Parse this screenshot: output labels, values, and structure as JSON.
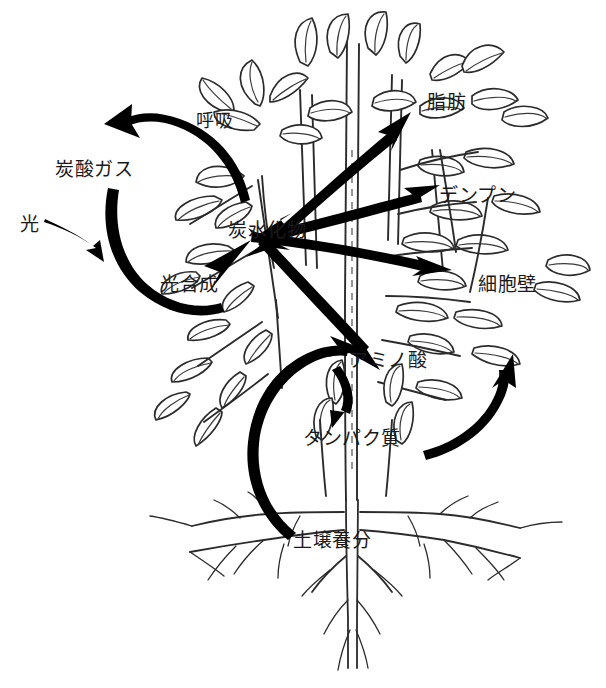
{
  "diagram": {
    "type": "plant-metabolism-flow-diagram",
    "colors": {
      "ink": "#1a1a1a",
      "arrow": "#000000",
      "background": "#ffffff",
      "line": "#2b2b2b"
    },
    "labels": [
      {
        "id": "respiration",
        "text": "呼吸",
        "x": 196,
        "y": 112,
        "role": "process"
      },
      {
        "id": "carbon-dioxide",
        "text": "炭酸ガス",
        "x": 55,
        "y": 160,
        "role": "substance"
      },
      {
        "id": "light",
        "text": "光",
        "x": 20,
        "y": 215,
        "role": "input"
      },
      {
        "id": "photosynthesis",
        "text": "光合成",
        "x": 160,
        "y": 275,
        "role": "process"
      },
      {
        "id": "carbohydrate",
        "text": "炭水化物",
        "x": 228,
        "y": 221,
        "role": "substance"
      },
      {
        "id": "fat",
        "text": "脂肪",
        "x": 427,
        "y": 93,
        "role": "substance"
      },
      {
        "id": "starch",
        "text": "デンプン",
        "x": 439,
        "y": 186,
        "role": "substance"
      },
      {
        "id": "cell-wall",
        "text": "細胞壁",
        "x": 478,
        "y": 275,
        "role": "substance"
      },
      {
        "id": "amino-acid",
        "text": "アミノ酸",
        "x": 349,
        "y": 351,
        "role": "substance"
      },
      {
        "id": "protein",
        "text": "タンパク質",
        "x": 303,
        "y": 429,
        "role": "substance"
      },
      {
        "id": "soil-nutrient",
        "text": "土壌養分",
        "x": 293,
        "y": 531,
        "role": "input"
      }
    ],
    "flows": [
      {
        "id": "flow-respiration-out",
        "from": "carbohydrate",
        "to": "carbon-dioxide",
        "style": "curved",
        "heads": 1
      },
      {
        "id": "flow-photosynthesis-in",
        "from": "light",
        "to": "carbohydrate",
        "style": "curved",
        "heads": 1
      },
      {
        "id": "flow-carb-fat",
        "from": "carbohydrate",
        "to": "fat",
        "style": "straight",
        "heads": 2
      },
      {
        "id": "flow-carb-starch",
        "from": "carbohydrate",
        "to": "starch",
        "style": "straight",
        "heads": 2
      },
      {
        "id": "flow-carb-cellwall",
        "from": "carbohydrate",
        "to": "cell-wall",
        "style": "straight",
        "heads": 1
      },
      {
        "id": "flow-carb-amino",
        "from": "carbohydrate",
        "to": "amino-acid",
        "style": "straight",
        "heads": 2
      },
      {
        "id": "flow-soil-amino",
        "from": "soil-nutrient",
        "to": "amino-acid",
        "style": "curved",
        "heads": 1
      },
      {
        "id": "flow-amino-protein",
        "from": "amino-acid",
        "to": "protein",
        "style": "curved",
        "heads": 1
      },
      {
        "id": "flow-protein-cellwall",
        "from": "protein",
        "to": "cell-wall",
        "style": "curved",
        "heads": 1
      }
    ],
    "plant": {
      "description": "hand-drawn outline of a leafy plant with central stem and fibrous root system",
      "parts": [
        "leaves",
        "stem",
        "branches",
        "roots"
      ]
    }
  }
}
